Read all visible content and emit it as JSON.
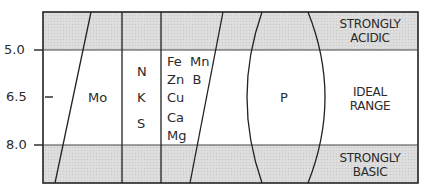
{
  "diagram": {
    "colors": {
      "band": "#d9d9d9",
      "line": "#222222",
      "background": "#ffffff"
    },
    "ph_ticks": [
      {
        "label": "5.0",
        "y": 50
      },
      {
        "label": "6.5",
        "y": 97
      },
      {
        "label": "8.0",
        "y": 145
      }
    ],
    "zones": {
      "acidic": {
        "line1": "STRONGLY",
        "line2": "ACIDIC"
      },
      "ideal": {
        "line1": "IDEAL",
        "line2": "RANGE"
      },
      "basic": {
        "line1": "STRONGLY",
        "line2": "BASIC"
      }
    },
    "nutrients": {
      "mo": "Mo",
      "nks": [
        "N",
        "K",
        "S"
      ],
      "micro": [
        "Fe  Mn",
        "Zn  B",
        "Cu",
        "Ca",
        "Mg"
      ],
      "p": "P"
    }
  }
}
